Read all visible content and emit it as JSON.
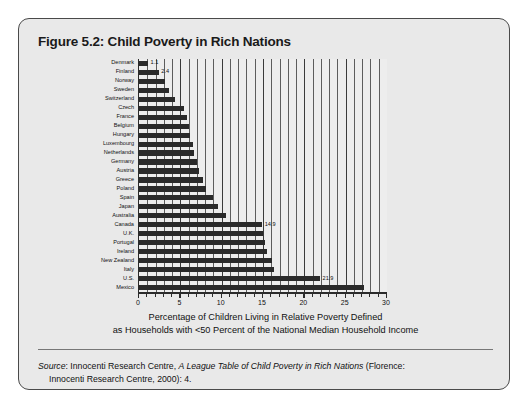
{
  "figure": {
    "title": "Figure 5.2: Child Poverty in Rich Nations",
    "source_label": "Source",
    "source_colon": ": Innocenti Research Centre, ",
    "source_work": "A League Table of Child Poverty in Rich Nations",
    "source_tail": " (Florence:",
    "source_line2": "Innocenti Research Centre, 2000): 4."
  },
  "axis_title": {
    "line1": "Percentage of Children Living in Relative Poverty Defined",
    "line2": "as Households with <50 Percent of the National Median Household Income"
  },
  "chart_data": {
    "type": "bar",
    "orientation": "horizontal",
    "title": "Figure 5.2: Child Poverty in Rich Nations",
    "xlabel": "Percentage of Children Living in Relative Poverty Defined as Households with <50 Percent of the National Median Household Income",
    "ylabel": "",
    "xlim": [
      0,
      30
    ],
    "xticks": [
      0,
      1,
      2,
      3,
      4,
      5,
      6,
      7,
      8,
      9,
      10,
      11,
      12,
      13,
      14,
      15,
      16,
      17,
      18,
      19,
      20,
      21,
      22,
      23,
      24,
      25,
      26,
      27,
      28,
      29,
      30
    ],
    "xtick_labels": [
      "0",
      "5",
      "10",
      "15",
      "20",
      "25",
      "30"
    ],
    "xtick_label_values": [
      0,
      5,
      10,
      15,
      20,
      25,
      30
    ],
    "grid": true,
    "grid_axis": "x",
    "legend": false,
    "bar_color": "#2a2a2a",
    "plot_background": "#ededed",
    "panel_background": "#e9e9e9",
    "categories": [
      "Denmark",
      "Finland",
      "Norway",
      "Sweden",
      "Switzerland",
      "Czech",
      "France",
      "Belgium",
      "Hungary",
      "Luxembourg",
      "Netherlands",
      "Germany",
      "Austria",
      "Greece",
      "Poland",
      "Spain",
      "Japan",
      "Australia",
      "Canada",
      "U.K.",
      "Portugal",
      "Ireland",
      "New Zealand",
      "Italy",
      "U.S.",
      "Mexico"
    ],
    "values": [
      1.1,
      2.4,
      3.1,
      3.6,
      4.4,
      5.4,
      5.8,
      6.0,
      6.2,
      6.5,
      6.7,
      7.0,
      7.2,
      7.7,
      8.1,
      8.9,
      9.5,
      10.5,
      14.9,
      15.0,
      15.3,
      15.5,
      16.1,
      16.3,
      21.9,
      27.2
    ],
    "value_labels": {
      "Denmark": "1.1",
      "Finland": "2.4",
      "Canada": "14.9",
      "U.S.": "21.9"
    }
  }
}
